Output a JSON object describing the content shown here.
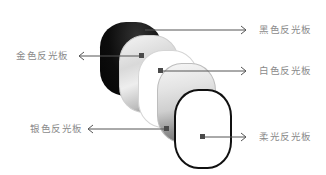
{
  "diagram": {
    "title": "",
    "labels": {
      "black": "黑色反光板",
      "gold": "金色反光板",
      "white": "白色反光板",
      "silver": "银色反光板",
      "diffuse": "柔光反光板"
    },
    "colors": {
      "background": "#ffffff",
      "label_text": "#8a8a8a",
      "leader_line": "#555555",
      "marker": "#4a4a4a",
      "black_panel": "#111111",
      "diffuse_outline": "#111111"
    }
  }
}
